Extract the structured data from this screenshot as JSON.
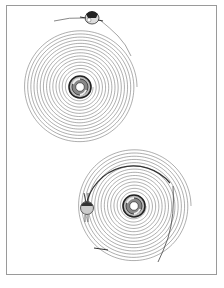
{
  "figure": {
    "caption": "Spiral groove illustration: upper spiral with detached stylus carriage, lower spiral with stylus carriage engaged on track",
    "frame_color": "#9a9a9a",
    "line_color": "#6a6a6a",
    "upper_spiral": {
      "center": [
        80,
        87
      ],
      "inner_radius": 13,
      "outer_radius": 57,
      "turns": 14,
      "component": "stylus-carriage-detached"
    },
    "lower_spiral": {
      "center": [
        134,
        206
      ],
      "inner_radius": 12,
      "outer_radius": 57,
      "turns": 14,
      "component": "stylus-ball-on-track"
    }
  }
}
